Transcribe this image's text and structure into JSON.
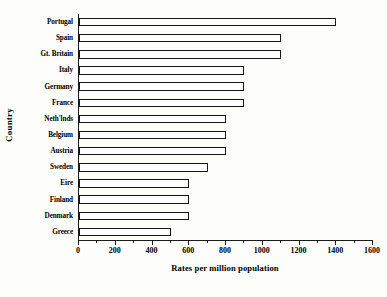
{
  "chart_data": {
    "type": "bar",
    "orientation": "horizontal",
    "title": "",
    "xlabel": "Rates per million population",
    "ylabel": "Country",
    "xlim": [
      0,
      1600
    ],
    "ylim": null,
    "grid": false,
    "legend": null,
    "xticks": [
      0,
      200,
      400,
      600,
      800,
      1000,
      1200,
      1400,
      1600
    ],
    "xtick_labels": [
      "0",
      "200",
      "400",
      "600",
      "800",
      "1000",
      "1200",
      "1400",
      "1600"
    ],
    "minor_tick_step": 100,
    "bar_fill_color": "#ffffff",
    "bar_edge_color": "#151515",
    "categories": [
      "Portugal",
      "Spain",
      "Gt. Britain",
      "Italy",
      "Germany",
      "France",
      "Neth'lnds",
      "Belgium",
      "Austria",
      "Sweden",
      "Eire",
      "Finland",
      "Denmark",
      "Greece"
    ],
    "values": [
      1400,
      1100,
      1100,
      900,
      900,
      900,
      800,
      800,
      800,
      700,
      600,
      600,
      600,
      500
    ]
  }
}
